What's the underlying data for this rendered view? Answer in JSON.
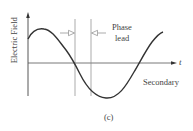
{
  "figure": {
    "ylabel": "Electric Field",
    "xlabel": "t",
    "curve_label": "Secondary",
    "annotation_line1": "Phase",
    "annotation_line2": "lead",
    "caption": "(c)"
  },
  "colors": {
    "curve": "#333333",
    "axis": "#444444",
    "guide": "#888888"
  }
}
